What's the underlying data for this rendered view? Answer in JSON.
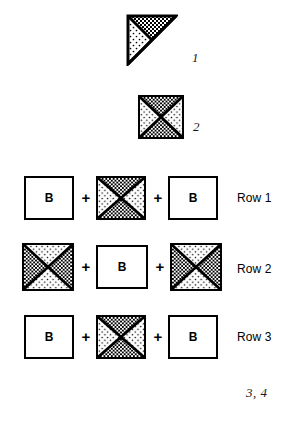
{
  "page": {
    "background_color": "#ffffff",
    "ink_color": "#000000",
    "width": 295,
    "height": 423
  },
  "figures": [
    {
      "id": "figure-1",
      "label": "1",
      "shape": "right-triangle",
      "fills": [
        "checkerboard",
        "dots"
      ]
    },
    {
      "id": "figure-2",
      "label": "2",
      "shape": "quadrant-square",
      "fills": {
        "top": "checkerboard",
        "bottom": "checkerboard",
        "left": "dots",
        "right": "dots"
      }
    }
  ],
  "rows": [
    {
      "label": "Row 1",
      "cells": [
        {
          "type": "letter-square",
          "letter": "B"
        },
        {
          "type": "operator",
          "symbol": "+"
        },
        {
          "type": "quadrant-square",
          "top": "checkerboard",
          "bottom": "checkerboard",
          "left": "dots",
          "right": "dots"
        },
        {
          "type": "operator",
          "symbol": "+"
        },
        {
          "type": "letter-square",
          "letter": "B"
        }
      ]
    },
    {
      "label": "Row 2",
      "cells": [
        {
          "type": "quadrant-square",
          "top": "dots",
          "bottom": "dots",
          "left": "checkerboard",
          "right": "checkerboard"
        },
        {
          "type": "operator",
          "symbol": "+"
        },
        {
          "type": "letter-square",
          "letter": "B"
        },
        {
          "type": "operator",
          "symbol": "+"
        },
        {
          "type": "quadrant-square",
          "top": "dots",
          "bottom": "dots",
          "left": "checkerboard",
          "right": "checkerboard"
        }
      ]
    },
    {
      "label": "Row 3",
      "cells": [
        {
          "type": "letter-square",
          "letter": "B"
        },
        {
          "type": "operator",
          "symbol": "+"
        },
        {
          "type": "quadrant-square",
          "top": "checkerboard",
          "bottom": "checkerboard",
          "left": "dots",
          "right": "dots"
        },
        {
          "type": "operator",
          "symbol": "+"
        },
        {
          "type": "letter-square",
          "letter": "B"
        }
      ]
    }
  ],
  "footer_label": "3, 4"
}
